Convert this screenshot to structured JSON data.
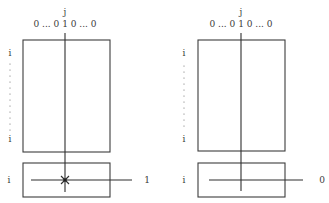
{
  "panels": [
    {
      "id": "left",
      "column_index_label": "j",
      "column_vector_label": "0 ... 0 1 0 ... 0",
      "row_label_top": "i",
      "row_label_bottom": "i",
      "lower_row_label": "i",
      "output_label": "1",
      "intersection_marker": "star",
      "colors": {
        "stroke": "#3c3c3c",
        "text": "#3a3a3a"
      }
    },
    {
      "id": "right",
      "column_index_label": "j",
      "column_vector_label": "0 ... 0 1 0 ... 0",
      "row_label_top": "i",
      "row_label_bottom": "i",
      "lower_row_label": "i",
      "output_label": "0",
      "intersection_marker": "none",
      "colors": {
        "stroke": "#3c3c3c",
        "text": "#3a3a3a"
      }
    }
  ]
}
